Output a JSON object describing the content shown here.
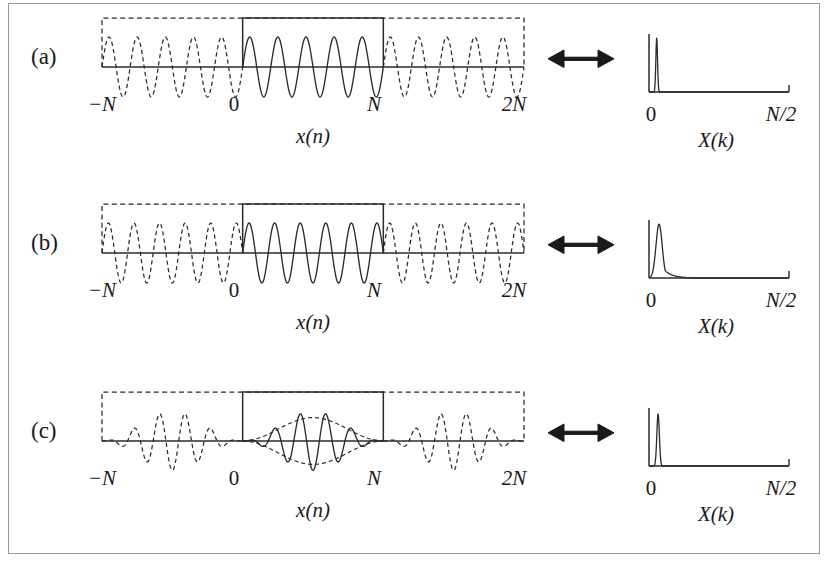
{
  "figure": {
    "border_color": "#9a9a9a",
    "background": "#ffffff",
    "ink_color": "#2b2b2b",
    "rows": [
      {
        "id": "a",
        "label": "(a)",
        "time_caption": "x(n)",
        "spectrum_caption": "X(k)",
        "time_axis_ticks": [
          "−N",
          "0",
          "N",
          "2N"
        ],
        "spectrum_axis_ticks": [
          "0",
          "N/2"
        ],
        "arrow_icon": "double-headed-arrow"
      },
      {
        "id": "b",
        "label": "(b)",
        "time_caption": "x(n)",
        "spectrum_caption": "X(k)",
        "time_axis_ticks": [
          "−N",
          "0",
          "N",
          "2N"
        ],
        "spectrum_axis_ticks": [
          "0",
          "N/2"
        ],
        "arrow_icon": "double-headed-arrow"
      },
      {
        "id": "c",
        "label": "(c)",
        "time_caption": "x(n)",
        "spectrum_caption": "X(k)",
        "time_axis_ticks": [
          "−N",
          "0",
          "N",
          "2N"
        ],
        "spectrum_axis_ticks": [
          "0",
          "N/2"
        ],
        "arrow_icon": "double-headed-arrow"
      }
    ]
  },
  "chart_data": [
    {
      "type": "line",
      "panel": "a",
      "role": "time-domain",
      "title": "",
      "xlabel": "x(n)",
      "ylabel": "",
      "xlim": [
        -1,
        2
      ],
      "ylim": [
        -1.15,
        1.15
      ],
      "xtick_values": [
        -1,
        0,
        1,
        2
      ],
      "xtick_labels": [
        "−N",
        "0",
        "N",
        "2N"
      ],
      "grid": false,
      "legend": false,
      "annotations": [
        "dashed box spans -N to 2N marking periodic extension",
        "solid box spans 0 to N marking the analysis window",
        "integer number of cycles inside window - no discontinuity"
      ],
      "series": [
        {
          "name": "sinusoid",
          "waveform": "sine",
          "cycles_per_window": 5,
          "amplitude": 1.0,
          "phase": 0,
          "envelope": "rectangular",
          "solid_range": [
            0,
            1
          ],
          "dashed_range": [
            [
              -1,
              0
            ],
            [
              1,
              2
            ]
          ]
        },
        {
          "name": "window-box",
          "waveform": "box",
          "top_level": 1.15,
          "solid_range": [
            0,
            1
          ],
          "dashed_range": [
            [
              -1,
              0
            ],
            [
              1,
              2
            ]
          ]
        }
      ]
    },
    {
      "type": "line",
      "panel": "a",
      "role": "spectrum",
      "xlabel": "X(k)",
      "xlim": [
        0,
        1
      ],
      "ylim": [
        0,
        1
      ],
      "xtick_values": [
        0,
        1
      ],
      "xtick_labels": [
        "0",
        "N/2"
      ],
      "grid": false,
      "legend": false,
      "annotations": [
        "single narrow spectral line, no leakage"
      ],
      "peaks": [
        {
          "position": 0.055,
          "height": 0.93,
          "half_width": 0.006
        }
      ],
      "baseline": 0.0
    },
    {
      "type": "line",
      "panel": "b",
      "role": "time-domain",
      "xlabel": "x(n)",
      "xlim": [
        -1,
        2
      ],
      "ylim": [
        -1.15,
        1.15
      ],
      "xtick_values": [
        -1,
        0,
        1,
        2
      ],
      "xtick_labels": [
        "−N",
        "0",
        "N",
        "2N"
      ],
      "grid": false,
      "legend": false,
      "annotations": [
        "dashed box spans -N to 2N marking periodic extension",
        "solid box spans 0 to N marking the analysis window",
        "non-integer number of cycles - discontinuity at window edges"
      ],
      "series": [
        {
          "name": "sinusoid",
          "waveform": "sine",
          "cycles_per_window": 5.5,
          "amplitude": 1.0,
          "phase": 0,
          "envelope": "rectangular",
          "solid_range": [
            0,
            1
          ],
          "dashed_range": [
            [
              -1,
              0
            ],
            [
              1,
              2
            ]
          ]
        },
        {
          "name": "window-box",
          "waveform": "box",
          "top_level": 1.15,
          "solid_range": [
            0,
            1
          ],
          "dashed_range": [
            [
              -1,
              0
            ],
            [
              1,
              2
            ]
          ]
        }
      ]
    },
    {
      "type": "line",
      "panel": "b",
      "role": "spectrum",
      "xlabel": "X(k)",
      "xlim": [
        0,
        1
      ],
      "ylim": [
        0,
        1
      ],
      "xtick_values": [
        0,
        1
      ],
      "xtick_labels": [
        "0",
        "N/2"
      ],
      "grid": false,
      "legend": false,
      "annotations": [
        "broadened peak with leakage skirt spreading to higher k"
      ],
      "peaks": [
        {
          "position": 0.072,
          "height": 0.93,
          "half_width": 0.022
        }
      ],
      "leakage": {
        "decay": 0.055,
        "extent": 0.45
      },
      "baseline": 0.0
    },
    {
      "type": "line",
      "panel": "c",
      "role": "time-domain",
      "xlabel": "x(n)",
      "xlim": [
        -1,
        2
      ],
      "ylim": [
        -1.15,
        1.15
      ],
      "xtick_values": [
        -1,
        0,
        1,
        2
      ],
      "xtick_labels": [
        "−N",
        "0",
        "N",
        "2N"
      ],
      "grid": false,
      "legend": false,
      "annotations": [
        "dashed box spans -N to 2N marking periodic extension",
        "solid box spans 0 to N marking the analysis window",
        "Hann window envelope tapers signal to zero at both edges"
      ],
      "series": [
        {
          "name": "windowed-sinusoid",
          "waveform": "sine",
          "cycles_per_window": 5.5,
          "amplitude": 1.0,
          "phase": 0,
          "envelope": "hann",
          "solid_range": [
            0,
            1
          ],
          "dashed_range": [
            [
              -1,
              0
            ],
            [
              1,
              2
            ]
          ]
        },
        {
          "name": "hann-envelope",
          "waveform": "hann-envelope",
          "amplitude": 0.78,
          "style": "dashed",
          "range": [
            0,
            1
          ]
        },
        {
          "name": "window-box",
          "waveform": "box",
          "top_level": 1.15,
          "solid_range": [
            0,
            1
          ],
          "dashed_range": [
            [
              -1,
              0
            ],
            [
              1,
              2
            ]
          ]
        }
      ]
    },
    {
      "type": "line",
      "panel": "c",
      "role": "spectrum",
      "xlabel": "X(k)",
      "xlim": [
        0,
        1
      ],
      "ylim": [
        0,
        1
      ],
      "xtick_values": [
        0,
        1
      ],
      "xtick_labels": [
        "0",
        "N/2"
      ],
      "grid": false,
      "legend": false,
      "annotations": [
        "narrow line restored, leakage suppressed by windowing"
      ],
      "peaks": [
        {
          "position": 0.065,
          "height": 0.9,
          "half_width": 0.009
        }
      ],
      "baseline": 0.0
    }
  ]
}
